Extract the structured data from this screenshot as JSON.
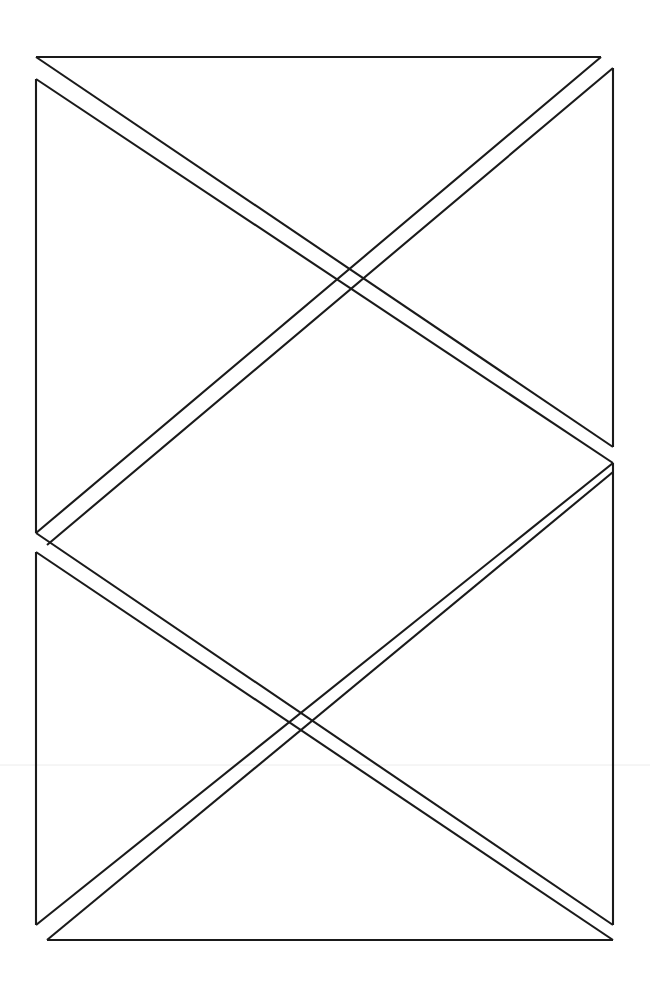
{
  "document": {
    "title": "Geometric Line Drawing",
    "kind": "scanned line drawing",
    "width": 650,
    "height": 984,
    "background_color": "#ffffff",
    "stroke_color": "#1a1a1a",
    "stroke_width": 2.1,
    "artifact_color": "#ececec",
    "description": "Scanned black-ink geometric figure: an open rectangular frame crossed by four double-line diagonals forming two X intersections."
  },
  "figure": {
    "name": "crease-pattern",
    "frame": {
      "name": "rectangle-frame",
      "note": "Rectangle outline drawn with small gaps on the left and right vertical edges.",
      "segments": [
        {
          "name": "frame-top-edge",
          "x1": 36,
          "y1": 57,
          "x2": 601,
          "y2": 57
        },
        {
          "name": "frame-left-edge-upper",
          "x1": 36,
          "y1": 79,
          "x2": 36,
          "y2": 533
        },
        {
          "name": "frame-left-edge-lower",
          "x1": 36,
          "y1": 552,
          "x2": 36,
          "y2": 925
        },
        {
          "name": "frame-right-edge-upper",
          "x1": 613,
          "y1": 68,
          "x2": 613,
          "y2": 447
        },
        {
          "name": "frame-right-edge-lower",
          "x1": 613,
          "y1": 463,
          "x2": 613,
          "y2": 925
        },
        {
          "name": "frame-bottom-edge",
          "x1": 47,
          "y1": 940,
          "x2": 613,
          "y2": 940
        }
      ]
    },
    "diagonals": [
      {
        "name": "diagonal-upper-descending",
        "direction": "top-left to mid-right",
        "pair": [
          {
            "name": "upper-descending-line-a",
            "x1": 36,
            "y1": 57,
            "x2": 613,
            "y2": 447
          },
          {
            "name": "upper-descending-line-b",
            "x1": 36,
            "y1": 79,
            "x2": 613,
            "y2": 463
          }
        ]
      },
      {
        "name": "diagonal-upper-ascending",
        "direction": "top-right to mid-left",
        "pair": [
          {
            "name": "upper-ascending-line-a",
            "x1": 601,
            "y1": 57,
            "x2": 36,
            "y2": 533
          },
          {
            "name": "upper-ascending-line-b",
            "x1": 613,
            "y1": 68,
            "x2": 47,
            "y2": 545
          }
        ]
      },
      {
        "name": "diagonal-lower-descending",
        "direction": "mid-left to bottom-right",
        "pair": [
          {
            "name": "lower-descending-line-a",
            "x1": 36,
            "y1": 533,
            "x2": 613,
            "y2": 925
          },
          {
            "name": "lower-descending-line-b",
            "x1": 36,
            "y1": 552,
            "x2": 613,
            "y2": 940
          }
        ]
      },
      {
        "name": "diagonal-lower-ascending",
        "direction": "bottom-left to mid-right",
        "pair": [
          {
            "name": "lower-ascending-line-a",
            "x1": 36,
            "y1": 925,
            "x2": 613,
            "y2": 463
          },
          {
            "name": "lower-ascending-line-b",
            "x1": 47,
            "y1": 940,
            "x2": 613,
            "y2": 472
          }
        ]
      }
    ],
    "intersections": [
      {
        "name": "intersection-upper",
        "x": 425,
        "y": 330
      },
      {
        "name": "intersection-lower",
        "x": 218,
        "y": 663
      }
    ],
    "artifacts": [
      {
        "name": "scan-artifact-horizontal-line",
        "x1": 0,
        "y1": 765,
        "x2": 650,
        "y2": 765
      }
    ]
  }
}
